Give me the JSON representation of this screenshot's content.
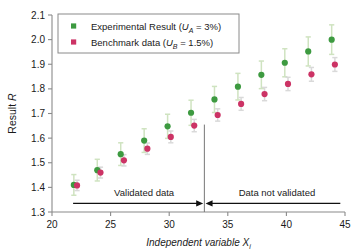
{
  "chart_data": {
    "type": "scatter",
    "title": "",
    "xlabel": "Independent variable  X",
    "xlabel_sub": "i",
    "ylabel": "Result  R",
    "xlim": [
      20,
      45
    ],
    "ylim": [
      1.3,
      2.1
    ],
    "xticks": [
      20,
      25,
      30,
      35,
      40,
      45
    ],
    "yticks": [
      "1.3",
      "1.4",
      "1.5",
      "1.6",
      "1.7",
      "1.8",
      "1.9",
      "2.0",
      "2.1"
    ],
    "grid": false,
    "legend_position": "upper-left",
    "x": [
      22,
      24,
      26,
      28,
      30,
      32,
      34,
      36,
      38,
      40,
      42,
      44
    ],
    "series": [
      {
        "name": "Experimental Result",
        "uncertainty_symbol": "U",
        "uncertainty_sub": "A",
        "uncertainty_value": "3%",
        "color": "#3d9a40",
        "errorbar_color": "#cfe3c0",
        "values": [
          1.41,
          1.47,
          1.535,
          1.59,
          1.648,
          1.703,
          1.757,
          1.809,
          1.857,
          1.906,
          1.952,
          2.0
        ],
        "errors": [
          0.042,
          0.044,
          0.046,
          0.048,
          0.049,
          0.051,
          0.053,
          0.054,
          0.056,
          0.057,
          0.059,
          0.06
        ]
      },
      {
        "name": "Benchmark data",
        "uncertainty_symbol": "U",
        "uncertainty_sub": "B",
        "uncertainty_value": "1.5%",
        "color": "#cc3365",
        "errorbar_color": "#d9d9d9",
        "values": [
          1.408,
          1.46,
          1.51,
          1.557,
          1.605,
          1.651,
          1.694,
          1.739,
          1.779,
          1.82,
          1.859,
          1.899
        ],
        "errors": [
          0.021,
          0.022,
          0.023,
          0.023,
          0.024,
          0.025,
          0.025,
          0.026,
          0.027,
          0.027,
          0.028,
          0.028
        ]
      }
    ],
    "annotations": [
      {
        "name": "validated-data",
        "text": "Validated data",
        "x_range": [
          21.8,
          32.9
        ]
      },
      {
        "name": "data-not-validated",
        "text": "Data not validated",
        "x_range": [
          33.1,
          44.6
        ]
      }
    ],
    "divider_x": 33
  }
}
